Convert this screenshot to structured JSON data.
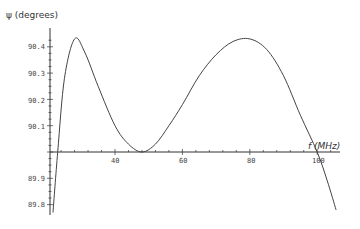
{
  "chart_data": {
    "type": "line",
    "title": "",
    "xlabel": "f (MHz)",
    "ylabel": "ψ (degrees)",
    "x_ticks": [
      40,
      60,
      80,
      100
    ],
    "y_ticks": [
      90.4,
      90.3,
      90.2,
      90.1,
      89.9,
      89.8
    ],
    "xlim": [
      20,
      106
    ],
    "ylim": [
      89.75,
      90.45
    ],
    "axis_origin": {
      "x": 20,
      "y": 90.0
    },
    "grid": false,
    "series": [
      {
        "name": "psi",
        "x": [
          21.6,
          23,
          25,
          28,
          31,
          35,
          40,
          44,
          48,
          52,
          56,
          60,
          65,
          70,
          75,
          80,
          85,
          90,
          95,
          100,
          103,
          105.6
        ],
        "y": [
          89.77,
          90.0,
          90.28,
          90.43,
          90.38,
          90.25,
          90.1,
          90.03,
          90.0,
          90.03,
          90.1,
          90.18,
          90.29,
          90.37,
          90.42,
          90.43,
          90.39,
          90.29,
          90.14,
          90.0,
          89.89,
          89.78
        ]
      }
    ]
  },
  "labels": {
    "ylabel": "ψ (degrees)",
    "xlabel": "f (MHz)",
    "xt": [
      "40",
      "60",
      "80",
      "100"
    ],
    "yt": [
      "90.4",
      "90.3",
      "90.2",
      "90.1",
      "89.9",
      "89.8"
    ]
  }
}
